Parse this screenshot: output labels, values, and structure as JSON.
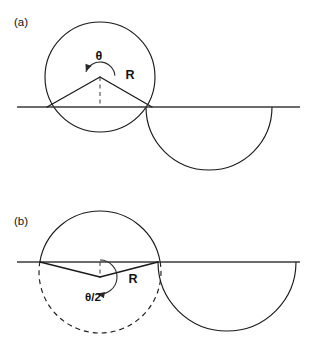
{
  "figure": {
    "background_color": "#ffffff",
    "line_color": "#1a1a1a",
    "baseline_color": "#3a3a3a",
    "width": 314,
    "height": 358
  },
  "panels": [
    {
      "id": "a",
      "label": "(a)",
      "label_x": 14,
      "label_y": 26,
      "baseline": {
        "x1": 17,
        "y1": 107,
        "x2": 300,
        "y2": 107
      },
      "main_circle": {
        "cx": 100,
        "cy": 77,
        "r": 55,
        "style": "solid",
        "description": "full circle drawn solid, center above the line"
      },
      "secondary_arc": {
        "cx": 209,
        "cy": 107,
        "r": 63,
        "style": "solid",
        "arc": "lower-semicircle",
        "description": "semicircular arc bulging below the line"
      },
      "vertex": {
        "x": 100,
        "y": 77
      },
      "chord_endpoints": [
        {
          "x": 47,
          "y": 107
        },
        {
          "x": 152,
          "y": 107
        }
      ],
      "dashed_segment": {
        "x1": 100,
        "y1": 77,
        "x2": 100,
        "y2": 107
      },
      "angle_label": {
        "text": "θ",
        "x": 99,
        "y": 60,
        "size": "large"
      },
      "radius_label": {
        "text": "R",
        "x": 130,
        "y": 79
      },
      "angle_arc": {
        "cx": 100,
        "cy": 77,
        "r": 15,
        "start_deg": 200,
        "end_deg": 355,
        "arrow_at": "start",
        "description": "reflex-style arc above vertex with arrowhead on the left end"
      }
    },
    {
      "id": "b",
      "label": "(b)",
      "label_x": 14,
      "label_y": 225,
      "baseline": {
        "x1": 17,
        "y1": 262,
        "x2": 300,
        "y2": 262
      },
      "main_circle": {
        "cx": 100,
        "cy": 272,
        "r": 61,
        "style": "upper-solid-lower-dashed",
        "description": "circle with the arc above the line solid and the arc below the line dashed"
      },
      "secondary_arc": {
        "cx": 227,
        "cy": 262,
        "r": 69,
        "style": "solid",
        "arc": "lower-semicircle",
        "description": "semicircular arc bulging below the line"
      },
      "vertex": {
        "x": 100,
        "y": 277
      },
      "chord_endpoints": [
        {
          "x": 40,
          "y": 262
        },
        {
          "x": 158,
          "y": 262
        }
      ],
      "dashed_segment": {
        "x1": 100,
        "y1": 262,
        "x2": 100,
        "y2": 277
      },
      "angle_label": {
        "text": "θ/2",
        "x": 93,
        "y": 301,
        "size": "small"
      },
      "radius_label": {
        "text": "R",
        "x": 133,
        "y": 283
      },
      "angle_arc": {
        "cx": 100,
        "cy": 277,
        "r": 17,
        "start_deg": 270,
        "end_deg": 100,
        "arrow_at": "end",
        "description": "arc sweeping from the dashed vertical around the lower left with arrowhead pointing up at the vertex"
      }
    }
  ]
}
